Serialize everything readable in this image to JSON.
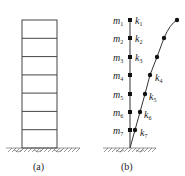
{
  "panel_a": {
    "caption": "(a)",
    "stories": 7
  },
  "panel_b": {
    "caption": "(b)",
    "masses": [
      {
        "label": "m",
        "sub": "1"
      },
      {
        "label": "m",
        "sub": "2"
      },
      {
        "label": "m",
        "sub": "3"
      },
      {
        "label": "m",
        "sub": "4"
      },
      {
        "label": "m",
        "sub": "5"
      },
      {
        "label": "m",
        "sub": "6"
      },
      {
        "label": "m",
        "sub": "7"
      }
    ],
    "stiffness": [
      {
        "label": "k",
        "sub": "1"
      },
      {
        "label": "k",
        "sub": "2"
      },
      {
        "label": "k",
        "sub": "3"
      },
      {
        "label": "k",
        "sub": "4"
      },
      {
        "label": "k",
        "sub": "5"
      },
      {
        "label": "k",
        "sub": "6"
      },
      {
        "label": "k",
        "sub": "7"
      }
    ]
  },
  "colors": {
    "line": "#333333",
    "node": "#111111"
  }
}
